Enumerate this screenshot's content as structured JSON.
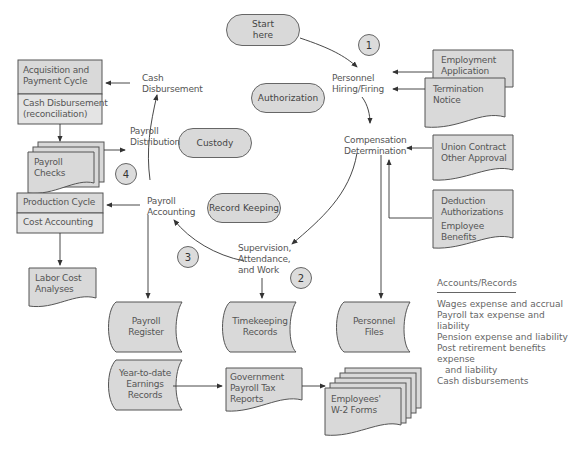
{
  "diagram": {
    "type": "flowchart",
    "start": {
      "label_line1": "Start",
      "label_line2": "here"
    },
    "steps": [
      {
        "number": "1",
        "label": "Personnel Hiring/Firing",
        "line1": "Personnel",
        "line2": "Hiring/Firing"
      },
      {
        "label": "Compensation Determination",
        "line1": "Compensation",
        "line2": "Determination"
      },
      {
        "number": "2",
        "label": "Supervision, Attendance, and Work",
        "line1": "Supervision,",
        "line2": "Attendance,",
        "line3": "and Work"
      },
      {
        "number": "3",
        "label": "Payroll Accounting",
        "line1": "Payroll",
        "line2": "Accounting"
      },
      {
        "number": "4",
        "label": "Payroll Distribution",
        "line1": "Payroll",
        "line2": "Distribution"
      },
      {
        "label": "Cash Disbursement",
        "line1": "Cash",
        "line2": "Disbursement"
      }
    ],
    "controls": {
      "authorization": "Authorization",
      "custody": "Custody",
      "record_keeping": "Record Keeping"
    },
    "step_numbers": {
      "n1": "1",
      "n2": "2",
      "n3": "3",
      "n4": "4"
    },
    "documents": {
      "employment_application": {
        "line1": "Employment",
        "line2": "Application"
      },
      "termination_notice": {
        "line1": "Termination",
        "line2": "Notice"
      },
      "union_contract": {
        "line1": "Union Contract",
        "line2": "Other Approval"
      },
      "deduction_auth": {
        "line1": "Deduction",
        "line2": "Authorizations",
        "line3": "Employee",
        "line4": "Benefits"
      },
      "payroll_checks": {
        "line1": "Payroll",
        "line2": "Checks"
      },
      "labor_cost": {
        "line1": "Labor Cost",
        "line2": "Analyses"
      },
      "gov_tax_reports": {
        "line1": "Government",
        "line2": "Payroll Tax",
        "line3": "Reports"
      },
      "w2_forms": {
        "line1": "Employees'",
        "line2": "W-2 Forms"
      }
    },
    "files": {
      "payroll_register": {
        "line1": "Payroll",
        "line2": "Register"
      },
      "timekeeping": {
        "line1": "Timekeeping",
        "line2": "Records"
      },
      "personnel_files": {
        "line1": "Personnel",
        "line2": "Files"
      },
      "ytd_earnings": {
        "line1": "Year-to-date",
        "line2": "Earnings",
        "line3": "Records"
      }
    },
    "external_cycles": {
      "acquisition": {
        "top_line1": "Acquisition and",
        "top_line2": "Payment Cycle",
        "bottom_line1": "Cash Disbursement",
        "bottom_line2": "(reconciliation)"
      },
      "production": {
        "top": "Production Cycle",
        "bottom": "Cost Accounting"
      }
    },
    "legend": {
      "title": "Accounts/Records",
      "items": [
        "Wages expense and accrual",
        "Payroll tax expense and liability",
        "Pension expense and liability",
        "Post retirement benefits expense",
        "and liability",
        "Cash disbursements"
      ]
    },
    "colors": {
      "shape_fill": "#d9d9d9",
      "stroke": "#555555",
      "text": "#555555"
    }
  }
}
